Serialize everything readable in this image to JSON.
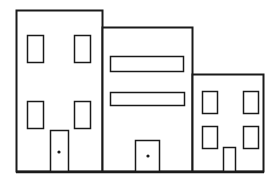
{
  "illustration": {
    "subject": "three-buildings-line-drawing",
    "stroke_color": "#1a1a1a",
    "fill_color": "#ffffff",
    "buildings": [
      {
        "name": "left-building",
        "windows": 4,
        "door": true,
        "door_knob": true
      },
      {
        "name": "middle-building",
        "window_bands": 2,
        "door": true,
        "door_knob": true
      },
      {
        "name": "right-building",
        "windows": 4,
        "door": true,
        "door_knob": false
      }
    ]
  }
}
